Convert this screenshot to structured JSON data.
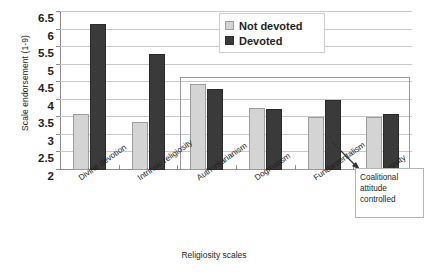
{
  "chart_data": {
    "type": "bar",
    "title": "",
    "xlabel": "Religiosity scales",
    "ylabel": "Scale endorsement (1-9)",
    "ylim": [
      2,
      6.5
    ],
    "yticks": [
      2,
      2.5,
      3,
      3.5,
      4,
      4.5,
      5,
      5.5,
      6,
      6.5
    ],
    "ytick_labels": [
      "2",
      "2.5",
      "3",
      "3.5",
      "4",
      "4.5",
      "5",
      "5.5",
      "6",
      "6.5"
    ],
    "grid": true,
    "legend_position": "top-right",
    "categories": [
      "Divine devotion",
      "Intrinsic religiosity",
      "Authoritarianism",
      "Dogmatism",
      "Fundamentalism",
      "Exclusivity"
    ],
    "series": [
      {
        "name": "Not devoted",
        "color": "#d4d4d4",
        "values": [
          3.6,
          3.37,
          4.45,
          3.77,
          3.5,
          3.5
        ]
      },
      {
        "name": "Devoted",
        "color": "#3a3a3a",
        "values": [
          6.15,
          5.3,
          4.3,
          3.73,
          4.0,
          3.6
        ]
      }
    ],
    "annotations": [
      {
        "text": "Coalitional attitude controlled",
        "lines": [
          "Coalitional",
          "attitude",
          "controlled"
        ],
        "points_to": "inner-box-region"
      }
    ],
    "inner_box": {
      "label": "coalitional-attitude-controlled-region",
      "categories": [
        "Authoritarianism",
        "Dogmatism",
        "Fundamentalism",
        "Exclusivity"
      ],
      "top_value": 4.65
    }
  },
  "legend": {
    "items": [
      {
        "label": "Not devoted",
        "swatch": "light-gray-swatch"
      },
      {
        "label": "Devoted",
        "swatch": "dark-gray-swatch"
      }
    ]
  },
  "annotation": {
    "line1": "Coalitional",
    "line2": "attitude",
    "line3": "controlled"
  }
}
